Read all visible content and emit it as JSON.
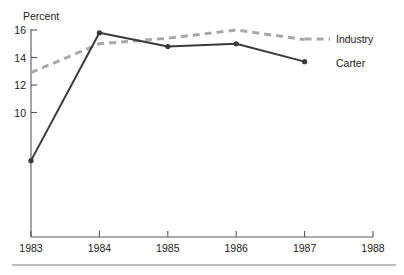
{
  "chart_data": {
    "type": "line",
    "title": "",
    "xlabel": "",
    "ylabel": "Percent",
    "x": [
      1983,
      1984,
      1985,
      1986,
      1987,
      1988
    ],
    "categories": [
      "1983",
      "1984",
      "1985",
      "1986",
      "1987",
      "1988"
    ],
    "xlim": [
      1983,
      1988
    ],
    "ylim": [
      6.0,
      16.0
    ],
    "yticks": [
      16,
      14,
      12,
      10
    ],
    "ytick_labels": [
      "16",
      "14",
      "12",
      "10"
    ],
    "xticks": [
      1983,
      1984,
      1985,
      1986,
      1987,
      1988
    ],
    "xtick_labels": [
      "1983",
      "1984",
      "1985",
      "1986",
      "1987",
      "1988"
    ],
    "grid": false,
    "legend_position": "right-inline-labels",
    "series": [
      {
        "name": "Industry",
        "style": "dashed",
        "color": "#a8a8a8",
        "marker": "none",
        "x": [
          1983,
          1984,
          1985,
          1986,
          1987
        ],
        "values": [
          12.9,
          15.0,
          15.4,
          16.0,
          15.3
        ]
      },
      {
        "name": "Carter",
        "style": "solid",
        "color": "#3a3a3a",
        "marker": "circle",
        "x": [
          1983,
          1984,
          1985,
          1986,
          1987
        ],
        "values": [
          6.5,
          15.8,
          14.8,
          15.0,
          13.7
        ]
      }
    ]
  },
  "axes": {
    "y_axis_title": "Percent",
    "y_tick_labels": [
      "16",
      "14",
      "12",
      "10"
    ],
    "x_tick_labels": [
      "1983",
      "1984",
      "1985",
      "1986",
      "1987",
      "1988"
    ]
  },
  "series_labels": {
    "industry": "Industry",
    "carter": "Carter"
  },
  "colors": {
    "industry_line": "#a8a8a8",
    "carter_line": "#3a3a3a",
    "axis": "#58585a",
    "text": "#1b1b1b",
    "rule": "#7c7c7e",
    "background": "#ffffff"
  }
}
